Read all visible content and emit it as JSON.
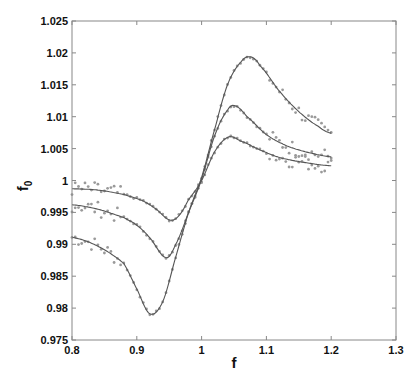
{
  "chart_data": {
    "type": "line",
    "title": "",
    "xlabel": "f",
    "ylabel": "f_0",
    "xlim": [
      0.8,
      1.3
    ],
    "ylim": [
      0.975,
      1.025
    ],
    "xticks": [
      0.8,
      0.9,
      1.0,
      1.1,
      1.2,
      1.3
    ],
    "xtick_labels": [
      "0.8",
      "0.9",
      "1",
      "1.1",
      "1.2",
      "1.3"
    ],
    "yticks": [
      0.975,
      0.98,
      0.985,
      0.99,
      0.995,
      1.0,
      1.005,
      1.01,
      1.015,
      1.02,
      1.025
    ],
    "ytick_labels": [
      "0.975",
      "0.98",
      "0.985",
      "0.99",
      "0.995",
      "1",
      "1.005",
      "1.01",
      "1.015",
      "1.02",
      "1.025"
    ],
    "grid": false,
    "legend": null,
    "colors": {
      "line": "#555555",
      "scatter": "#9a9a9a",
      "axis": "#888888"
    },
    "series": [
      {
        "name": "curve-large-amplitude",
        "style": "line-with-scatter",
        "x": [
          0.8,
          0.84,
          0.88,
          0.9,
          0.92,
          0.94,
          0.96,
          0.98,
          1.0,
          1.02,
          1.04,
          1.06,
          1.075,
          1.09,
          1.12,
          1.15,
          1.18,
          1.2
        ],
        "y": [
          0.9911,
          0.9897,
          0.987,
          0.983,
          0.9791,
          0.981,
          0.988,
          0.995,
          1.0005,
          1.008,
          1.015,
          1.0185,
          1.0194,
          1.018,
          1.014,
          1.0108,
          1.0085,
          1.0074
        ]
      },
      {
        "name": "curve-medium-amplitude",
        "style": "line-with-scatter",
        "x": [
          0.8,
          0.84,
          0.88,
          0.9,
          0.92,
          0.945,
          0.96,
          0.98,
          1.0,
          1.02,
          1.04,
          1.052,
          1.07,
          1.1,
          1.13,
          1.16,
          1.2
        ],
        "y": [
          0.9962,
          0.9955,
          0.9942,
          0.993,
          0.991,
          0.9879,
          0.99,
          0.995,
          1.0002,
          1.007,
          1.011,
          1.0117,
          1.01,
          1.0072,
          1.0055,
          1.0045,
          1.0037
        ]
      },
      {
        "name": "curve-small-amplitude",
        "style": "line-with-scatter",
        "x": [
          0.8,
          0.84,
          0.88,
          0.91,
          0.93,
          0.951,
          0.965,
          0.98,
          1.0,
          1.02,
          1.041,
          1.06,
          1.09,
          1.12,
          1.16,
          1.2
        ],
        "y": [
          0.9987,
          0.9985,
          0.9978,
          0.9968,
          0.9955,
          0.9938,
          0.9945,
          0.997,
          1.0,
          1.0045,
          1.0068,
          1.0062,
          1.0048,
          1.0036,
          1.0028,
          1.0023
        ]
      }
    ]
  }
}
